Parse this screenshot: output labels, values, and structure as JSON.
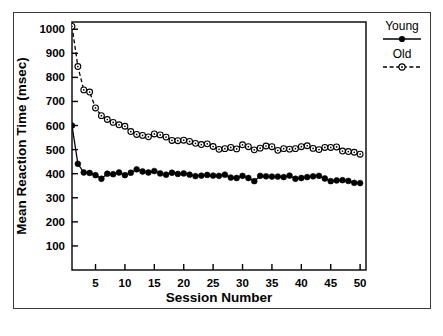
{
  "figure": {
    "background_color": "#ffffff",
    "frame_color": "#3a3a3a",
    "ink_color": "#000000"
  },
  "chart_data": {
    "type": "line",
    "title": "",
    "subtitle": "",
    "xlabel": "Session Number",
    "ylabel": "Mean Reaction Time (msec)",
    "xlim": [
      1,
      51
    ],
    "ylim": [
      0,
      1030
    ],
    "xticks": [
      5,
      10,
      15,
      20,
      25,
      30,
      35,
      40,
      45,
      50
    ],
    "xticklabels": [
      "5",
      "10",
      "15",
      "20",
      "25",
      "30",
      "35",
      "40",
      "45",
      "50"
    ],
    "yticks": [
      100,
      200,
      300,
      400,
      500,
      600,
      700,
      800,
      900,
      1000
    ],
    "yticklabels": [
      "100",
      "200",
      "300",
      "400",
      "500",
      "600",
      "700",
      "800",
      "900",
      "1000"
    ],
    "grid": false,
    "legend_position": "outside-top-right",
    "x": [
      1,
      2,
      3,
      4,
      5,
      6,
      7,
      8,
      9,
      10,
      11,
      12,
      13,
      14,
      15,
      16,
      17,
      18,
      19,
      20,
      21,
      22,
      23,
      24,
      25,
      26,
      27,
      28,
      29,
      30,
      31,
      32,
      33,
      34,
      35,
      36,
      37,
      38,
      39,
      40,
      41,
      42,
      43,
      44,
      45,
      46,
      47,
      48,
      49,
      50
    ],
    "series": [
      {
        "name": "Young",
        "marker": "filled-circle",
        "linestyle": "solid",
        "color": "#000000",
        "values": [
          600,
          441,
          405,
          403,
          394,
          379,
          400,
          398,
          405,
          394,
          404,
          418,
          409,
          405,
          411,
          401,
          396,
          404,
          399,
          401,
          396,
          390,
          392,
          395,
          392,
          391,
          396,
          384,
          382,
          391,
          382,
          369,
          391,
          389,
          388,
          388,
          386,
          392,
          379,
          382,
          386,
          389,
          391,
          380,
          369,
          372,
          373,
          370,
          362,
          361
        ]
      },
      {
        "name": "Old",
        "marker": "open-circle",
        "linestyle": "dashed",
        "color": "#000000",
        "values": [
          1012,
          845,
          748,
          739,
          673,
          641,
          625,
          613,
          603,
          597,
          575,
          563,
          559,
          553,
          565,
          561,
          552,
          538,
          537,
          539,
          534,
          526,
          521,
          524,
          513,
          501,
          504,
          509,
          503,
          520,
          512,
          499,
          506,
          515,
          512,
          497,
          504,
          502,
          504,
          512,
          516,
          505,
          500,
          509,
          509,
          511,
          494,
          492,
          489,
          481
        ]
      }
    ],
    "annotations": []
  },
  "legend": {
    "items": [
      {
        "label": "Young",
        "marker": "filled-circle",
        "linestyle": "solid"
      },
      {
        "label": "Old",
        "marker": "open-circle",
        "linestyle": "dashed"
      }
    ]
  }
}
